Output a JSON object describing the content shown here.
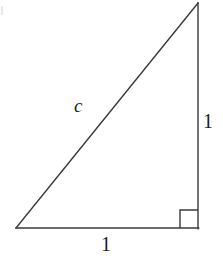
{
  "figure": {
    "kind": "right-triangle-diagram",
    "background_color": "#ffffff",
    "stroke_color": "#3a3a3a",
    "text_color": "#1a1a1a",
    "stroke_width": 1.4
  },
  "geometry": {
    "vertices": {
      "bottom_left": {
        "x": 16,
        "y": 228
      },
      "bottom_right": {
        "x": 198,
        "y": 228
      },
      "apex_top": {
        "x": 198,
        "y": 3
      }
    },
    "right_angle_marker": {
      "at_vertex": "bottom_right",
      "x": 180,
      "y": 210,
      "size": 18
    }
  },
  "labels": {
    "hypotenuse": "c",
    "vertical_leg": "1",
    "horizontal_leg": "1"
  },
  "sides": [
    {
      "name": "hypotenuse",
      "label": "c",
      "from": "bottom_left",
      "to": "apex_top"
    },
    {
      "name": "vertical-leg",
      "label": "1",
      "from": "bottom_right",
      "to": "apex_top"
    },
    {
      "name": "horizontal-leg",
      "label": "1",
      "from": "bottom_left",
      "to": "bottom_right"
    }
  ]
}
